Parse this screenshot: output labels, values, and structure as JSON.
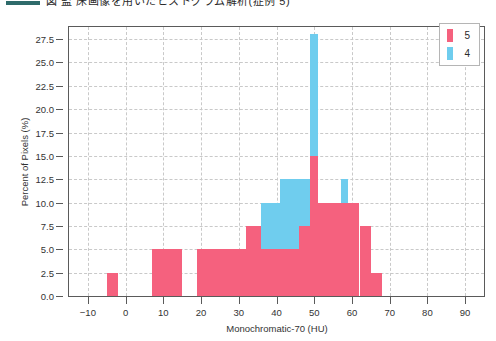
{
  "caption": {
    "rule_color": "#2e6b6b",
    "text": "図 監 床画像を用いたヒストグラム解析(症例 5)"
  },
  "chart_data": {
    "type": "bar",
    "title": "",
    "subtitle": "",
    "xlabel": "Monochromatic-70 (HU)",
    "ylabel": "Percent of Pixels (%)",
    "xlim": [
      -15,
      95
    ],
    "ylim": [
      0,
      28.8
    ],
    "xticks": [
      -10,
      0,
      10,
      20,
      30,
      40,
      50,
      60,
      70,
      80,
      90
    ],
    "xtick_labels": [
      "−10",
      "0",
      "10",
      "20",
      "30",
      "40",
      "50",
      "60",
      "70",
      "80",
      "90"
    ],
    "yticks": [
      0.0,
      2.5,
      5.0,
      7.5,
      10.0,
      12.5,
      15.0,
      17.5,
      20.0,
      22.5,
      25.0,
      27.5
    ],
    "ytick_labels": [
      "0.0",
      "2.5",
      "5.0",
      "7.5",
      "10.0",
      "12.5",
      "15.0",
      "17.5",
      "20.0",
      "22.5",
      "25.0",
      "27.5"
    ],
    "grid": true,
    "grid_style": "dashed",
    "legend_position": "upper right",
    "bin_width": 3,
    "series": [
      {
        "name": "5",
        "color": "#F5617E",
        "bins": [
          {
            "x0": -5,
            "x1": -2,
            "value": 2.5
          },
          {
            "x0": 7,
            "x1": 15,
            "value": 5.0
          },
          {
            "x0": 19,
            "x1": 32,
            "value": 5.0
          },
          {
            "x0": 32,
            "x1": 36,
            "value": 7.5
          },
          {
            "x0": 36,
            "x1": 41,
            "value": 5.0
          },
          {
            "x0": 41,
            "x1": 46,
            "value": 5.0
          },
          {
            "x0": 46,
            "x1": 49,
            "value": 7.5
          },
          {
            "x0": 49,
            "x1": 51,
            "value": 15.0
          },
          {
            "x0": 51,
            "x1": 54,
            "value": 10.0
          },
          {
            "x0": 54,
            "x1": 62,
            "value": 10.0
          },
          {
            "x0": 62,
            "x1": 65,
            "value": 7.5
          },
          {
            "x0": 65,
            "x1": 68,
            "value": 2.5
          }
        ]
      },
      {
        "name": "4",
        "color": "#6FCDEE",
        "bins": [
          {
            "x0": 36,
            "x1": 41,
            "value": 10.0
          },
          {
            "x0": 41,
            "x1": 46,
            "value": 12.5
          },
          {
            "x0": 46,
            "x1": 49,
            "value": 12.5
          },
          {
            "x0": 49,
            "x1": 51,
            "value": 28.0
          },
          {
            "x0": 57,
            "x1": 59,
            "value": 12.5
          }
        ]
      }
    ]
  },
  "legend": {
    "entries": [
      {
        "label": "5",
        "color": "#F5617E"
      },
      {
        "label": "4",
        "color": "#6FCDEE"
      }
    ]
  }
}
